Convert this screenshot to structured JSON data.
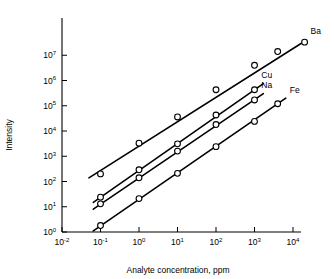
{
  "chart_data": {
    "type": "line",
    "title": "",
    "xlabel": "Analyte concentration, ppm",
    "ylabel": "Intensity",
    "xscale": "log",
    "yscale": "log",
    "xlim": [
      0.01,
      10000
    ],
    "ylim": [
      1,
      100000000
    ],
    "grid": false,
    "legend_position": "right-end-of-line",
    "xtick_labels": [
      "10−2",
      "10−1",
      "10⁰",
      "10¹",
      "10²",
      "10³",
      "10⁴"
    ],
    "xtick_values": [
      0.01,
      0.1,
      1,
      10,
      100,
      1000,
      10000
    ],
    "xtick_bases": [
      "10",
      "10",
      "10",
      "10",
      "10",
      "10",
      "10"
    ],
    "xtick_exponents": [
      "-2",
      "-1",
      "0",
      "1",
      "2",
      "3",
      "4"
    ],
    "ytick_values": [
      1,
      10,
      100,
      1000,
      10000,
      100000,
      1000000,
      10000000
    ],
    "ytick_bases": [
      "10",
      "10",
      "10",
      "10",
      "10",
      "10",
      "10",
      "10"
    ],
    "ytick_exponents": [
      "0",
      "1",
      "2",
      "3",
      "4",
      "5",
      "6",
      "7"
    ],
    "marker": "open-circle",
    "series": [
      {
        "name": "Ba",
        "label": "Ba",
        "x": [
          0.1,
          1,
          10,
          100,
          1000,
          4000,
          20000
        ],
        "y": [
          200,
          3300,
          36000,
          430000,
          4000000,
          14000000,
          33000000
        ],
        "line_start": [
          0.05,
          140
        ],
        "line_end": [
          20000,
          36000000
        ]
      },
      {
        "name": "Cu",
        "label": "Cu",
        "x": [
          0.1,
          1,
          10,
          100,
          1000
        ],
        "y": [
          24,
          290,
          3100,
          43000,
          430000
        ],
        "line_start": [
          0.065,
          15
        ],
        "line_end": [
          1700,
          750000
        ]
      },
      {
        "name": "Na",
        "label": "Na",
        "x": [
          0.1,
          1,
          10,
          100,
          1000
        ],
        "y": [
          13,
          140,
          1600,
          18000,
          170000
        ],
        "line_start": [
          0.065,
          8
        ],
        "line_end": [
          1700,
          300000
        ]
      },
      {
        "name": "Fe",
        "label": "Fe",
        "x": [
          0.1,
          1,
          10,
          100,
          1000,
          4000
        ],
        "y": [
          1.8,
          21,
          210,
          2400,
          24000,
          120000
        ],
        "line_start": [
          0.065,
          1.1
        ],
        "line_end": [
          6500,
          200000
        ]
      }
    ]
  }
}
